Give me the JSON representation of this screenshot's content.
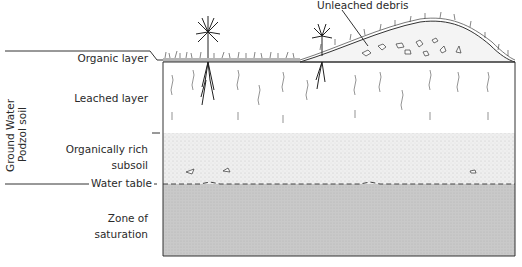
{
  "diagram": {
    "side_labels": {
      "line1": "Ground Water",
      "line2": "Podzol soil"
    },
    "layers": [
      {
        "id": "organic",
        "label": "Organic layer"
      },
      {
        "id": "leached",
        "label": "Leached layer"
      },
      {
        "id": "organically_rich",
        "label_line1": "Organically rich",
        "label_line2": "subsoil"
      },
      {
        "id": "water_table",
        "label": "Water table"
      },
      {
        "id": "saturation",
        "label_line1": "Zone of",
        "label_line2": "saturation"
      }
    ],
    "callout": "Unleached debris",
    "colors": {
      "saturation_fill": "#c8c8c8",
      "subsoil_fill": "#ececec",
      "leached_fill": "#ffffff",
      "line": "#333333"
    }
  }
}
